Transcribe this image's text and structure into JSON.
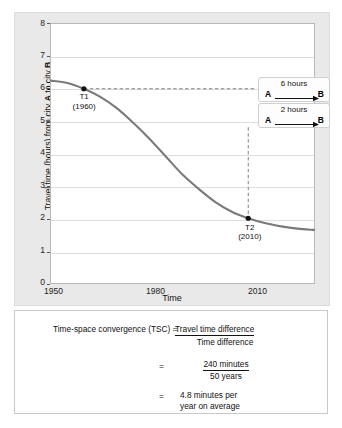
{
  "chart_data": {
    "type": "line",
    "title": "",
    "xlabel": "Time",
    "ylabel": "Travel time (hours) from city A to city B",
    "ylabel_parts": {
      "pre": "Travel time (hours) from city ",
      "bold_a": "A",
      "mid": " to city ",
      "bold_b": "B"
    },
    "xlim": [
      1950,
      2030
    ],
    "ylim": [
      0,
      8
    ],
    "yticks": [
      "8",
      "7",
      "6",
      "5",
      "4",
      "3",
      "2",
      "1",
      "0"
    ],
    "xticks": [
      "1950",
      "1980",
      "2010"
    ],
    "grid": true,
    "legend": "none",
    "series": [
      {
        "name": "Travel time A to B",
        "color": "#7a7a7a",
        "x": [
          1950,
          1955,
          1960,
          1965,
          1970,
          1975,
          1980,
          1985,
          1990,
          1995,
          2000,
          2005,
          2010,
          2015,
          2020,
          2025,
          2030
        ],
        "y": [
          6.25,
          6.18,
          6.0,
          5.75,
          5.4,
          4.95,
          4.45,
          3.9,
          3.35,
          2.9,
          2.5,
          2.2,
          2.0,
          1.85,
          1.75,
          1.68,
          1.64
        ]
      }
    ],
    "points": [
      {
        "id": "T1",
        "label": "T1",
        "year_label": "(1960)",
        "x": 1960,
        "y": 6
      },
      {
        "id": "T2",
        "label": "T2",
        "year_label": "(2010)",
        "x": 2010,
        "y": 2
      }
    ],
    "annotations": [
      {
        "id": "callout-t1",
        "text": "6 hours",
        "from": "A",
        "to": "B"
      },
      {
        "id": "callout-t2",
        "text": "2 hours",
        "from": "A",
        "to": "B"
      }
    ]
  },
  "formula": {
    "lhs": "Time-space convergence (TSC) =",
    "row1_numerator": "Travel time difference",
    "row1_denominator": "Time difference",
    "eq2": "=",
    "row2_numerator": "240 minutes",
    "row2_denominator": "50 years",
    "eq3": "=",
    "row3_line1": "4.8 minutes per",
    "row3_line2": "year on average"
  }
}
